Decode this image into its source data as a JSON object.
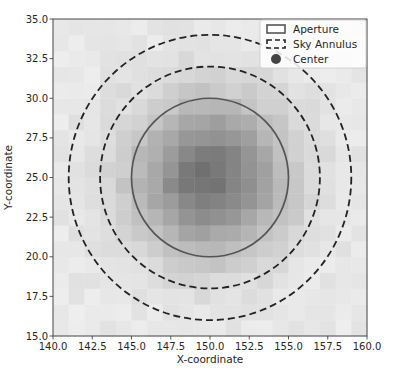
{
  "chart_data": {
    "type": "heatmap",
    "title": "",
    "xlabel": "X-coordinate",
    "ylabel": "Y-coordinate",
    "xlim": [
      140.0,
      160.0
    ],
    "ylim": [
      15.0,
      35.0
    ],
    "xticks": [
      "140.0",
      "142.5",
      "145.0",
      "147.5",
      "150.0",
      "152.5",
      "155.0",
      "157.5",
      "160.0"
    ],
    "yticks": [
      "15.0",
      "17.5",
      "20.0",
      "22.5",
      "25.0",
      "27.5",
      "30.0",
      "32.5",
      "35.0"
    ],
    "grid": false,
    "image": {
      "description": "Grayscale pixelated star image, darkest near center (150, 25), fading outward",
      "pixel_size": 1.0,
      "peak_center": [
        150.0,
        25.0
      ],
      "colormap": "gray_r"
    },
    "overlays": [
      {
        "name": "Aperture",
        "shape": "circle",
        "center": [
          150.0,
          25.0
        ],
        "radius": 5.0,
        "style": "solid",
        "color": "#555555"
      },
      {
        "name": "Sky Annulus inner",
        "shape": "circle",
        "center": [
          150.0,
          25.0
        ],
        "radius": 7.0,
        "style": "dashed",
        "color": "#222222"
      },
      {
        "name": "Sky Annulus outer",
        "shape": "circle",
        "center": [
          150.0,
          25.0
        ],
        "radius": 9.0,
        "style": "dashed",
        "color": "#222222"
      },
      {
        "name": "Center",
        "shape": "point",
        "x": 150.0,
        "y": 25.0,
        "color": "#444444"
      }
    ],
    "legend": {
      "position": "upper right",
      "entries": [
        "Aperture",
        "Sky Annulus",
        "Center"
      ]
    }
  },
  "labels": {
    "xlabel": "X-coordinate",
    "ylabel": "Y-coordinate",
    "legend_aperture": "Aperture",
    "legend_annulus": "Sky Annulus",
    "legend_center": "Center"
  }
}
